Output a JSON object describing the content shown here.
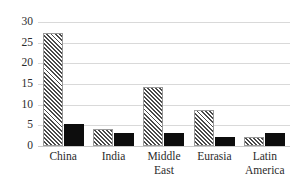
{
  "chart_data": {
    "type": "bar",
    "title": "",
    "subtitle": "",
    "xlabel": "",
    "ylabel": "",
    "categories": [
      "China",
      "India",
      "Middle East",
      "Eurasia",
      "Latin America"
    ],
    "series": [
      {
        "name": "hatched",
        "style": "diagonal-hatch",
        "values": [
          27.3,
          4.1,
          14.3,
          8.7,
          2.2
        ]
      },
      {
        "name": "solid",
        "style": "solid-black",
        "values": [
          5.3,
          3.1,
          3.2,
          2.2,
          3.1
        ]
      }
    ],
    "ylim": [
      0,
      30
    ],
    "yticks": [
      0,
      5,
      10,
      15,
      20,
      25,
      30
    ],
    "ytick_labels": [
      "0",
      "5",
      "10",
      "15",
      "20",
      "25",
      "30"
    ],
    "grid": true,
    "grid_axis": "y",
    "legend": false,
    "legend_position": "none",
    "colors": {
      "hatch_line": "#4a4a4a",
      "hatch_fill": "#ffffff",
      "solid": "#0d0d0d",
      "gridline": "#d9d9d9",
      "text": "#2b2b2b",
      "background": "#ffffff"
    }
  }
}
